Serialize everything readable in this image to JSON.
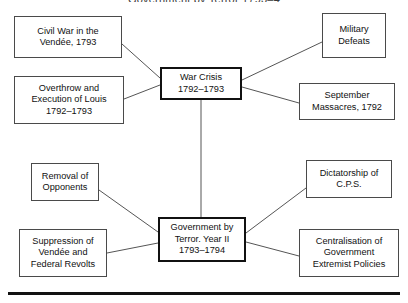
{
  "title": "Government by Terror 1793–4",
  "colors": {
    "box_border": "#4a4a4a",
    "central_border": "#111111",
    "connector": "#555555",
    "rule": "#111111",
    "background": "#ffffff",
    "text": "#111111"
  },
  "diagram": {
    "type": "concept-map",
    "nodes": [
      {
        "id": "civil-war-vendee",
        "label": "Civil War in the\nVendée, 1793",
        "x": 14,
        "y": 16,
        "w": 108,
        "h": 42,
        "central": false
      },
      {
        "id": "military-defeats",
        "label": "Military\nDefeats",
        "x": 322,
        "y": 13,
        "w": 64,
        "h": 45,
        "central": false
      },
      {
        "id": "war-crisis",
        "label": "War Crisis\n1792–1793",
        "x": 160,
        "y": 67,
        "w": 82,
        "h": 33,
        "central": true
      },
      {
        "id": "overthrow-execution-louis",
        "label": "Overthrow and\nExecution of Louis\n1792–1793",
        "x": 14,
        "y": 76,
        "w": 110,
        "h": 48,
        "central": false
      },
      {
        "id": "september-massacres",
        "label": "September\nMassacres, 1792",
        "x": 299,
        "y": 83,
        "w": 96,
        "h": 37,
        "central": false
      },
      {
        "id": "removal-of-opponents",
        "label": "Removal of\nOpponents",
        "x": 31,
        "y": 163,
        "w": 68,
        "h": 38,
        "central": false
      },
      {
        "id": "dictatorship-cps",
        "label": "Dictatorship of\nC.P.S.",
        "x": 306,
        "y": 160,
        "w": 86,
        "h": 38,
        "central": false
      },
      {
        "id": "government-by-terror",
        "label": "Government by\nTerror. Year II\n1793–1794",
        "x": 158,
        "y": 217,
        "w": 88,
        "h": 45,
        "central": true
      },
      {
        "id": "suppression-vendee-federal-revolts",
        "label": "Suppression of\nVendée and\nFederal Revolts",
        "x": 19,
        "y": 229,
        "w": 88,
        "h": 48,
        "central": false
      },
      {
        "id": "centralisation-government",
        "label": "Centralisation of\nGovernment\nExtremist Policies",
        "x": 299,
        "y": 229,
        "w": 100,
        "h": 48,
        "central": false
      }
    ],
    "edges": [
      {
        "id": "edge-civilwar-warcrisis",
        "from": "civil-war-vendee",
        "to": "war-crisis",
        "x1": 122,
        "y1": 44,
        "x2": 160,
        "y2": 78
      },
      {
        "id": "edge-overthrow-warcrisis",
        "from": "overthrow-execution-louis",
        "to": "war-crisis",
        "x1": 124,
        "y1": 99,
        "x2": 160,
        "y2": 85
      },
      {
        "id": "edge-warcrisis-military",
        "from": "war-crisis",
        "to": "military-defeats",
        "x1": 242,
        "y1": 80,
        "x2": 322,
        "y2": 42
      },
      {
        "id": "edge-warcrisis-september",
        "from": "war-crisis",
        "to": "september-massacres",
        "x1": 242,
        "y1": 87,
        "x2": 299,
        "y2": 103
      },
      {
        "id": "edge-warcrisis-terror",
        "from": "war-crisis",
        "to": "government-by-terror",
        "x1": 201,
        "y1": 100,
        "x2": 201,
        "y2": 217
      },
      {
        "id": "edge-removal-terror",
        "from": "removal-of-opponents",
        "to": "government-by-terror",
        "x1": 99,
        "y1": 190,
        "x2": 158,
        "y2": 232
      },
      {
        "id": "edge-suppression-terror",
        "from": "suppression-vendee-federal-revolts",
        "to": "government-by-terror",
        "x1": 107,
        "y1": 253,
        "x2": 158,
        "y2": 243
      },
      {
        "id": "edge-terror-dictatorship",
        "from": "government-by-terror",
        "to": "dictatorship-cps",
        "x1": 246,
        "y1": 233,
        "x2": 306,
        "y2": 188
      },
      {
        "id": "edge-terror-centralisation",
        "from": "government-by-terror",
        "to": "centralisation-government",
        "x1": 246,
        "y1": 242,
        "x2": 299,
        "y2": 256
      }
    ]
  }
}
